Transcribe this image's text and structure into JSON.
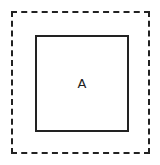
{
  "diagram": {
    "outer_box": {
      "style": "dashed",
      "color": "#222222"
    },
    "inner_box": {
      "style": "solid",
      "color": "#222222",
      "label": "A"
    }
  }
}
